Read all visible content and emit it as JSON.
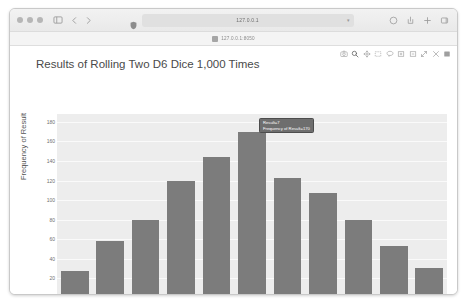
{
  "browser": {
    "traffic_lights": [
      "close",
      "minimize",
      "maximize"
    ],
    "sidebar_icon": "sidebar-icon",
    "back_icon": "chevron-left-icon",
    "forward_icon": "chevron-right-icon",
    "shield_icon": "shield-icon",
    "url_value": "127.0.0.1",
    "url_chevron": "chevron-down-icon",
    "right_icons": [
      "share-icon",
      "download-icon",
      "new-tab-icon",
      "tab-overview-icon"
    ],
    "bookmark": {
      "icon": "bookmark-icon",
      "label": "127.0.0.1:8050"
    }
  },
  "modebar": {
    "buttons": [
      {
        "name": "camera-icon",
        "label": "Download plot as a png"
      },
      {
        "name": "zoom-icon",
        "label": "Zoom"
      },
      {
        "name": "pan-icon",
        "label": "Pan"
      },
      {
        "name": "box-select-icon",
        "label": "Box Select"
      },
      {
        "name": "lasso-select-icon",
        "label": "Lasso Select"
      },
      {
        "name": "zoom-in-icon",
        "label": "Zoom in"
      },
      {
        "name": "zoom-out-icon",
        "label": "Zoom out"
      },
      {
        "name": "autoscale-icon",
        "label": "Autoscale"
      },
      {
        "name": "reset-axes-icon",
        "label": "Reset axes"
      },
      {
        "name": "toggle-spikelines-icon",
        "label": "Toggle Spike Lines"
      }
    ]
  },
  "tooltip": {
    "line1": "Result=7",
    "line2": "Frequency of Result=170"
  },
  "chart_data": {
    "type": "bar",
    "title": "Results of Rolling Two D6 Dice 1,000 Times",
    "xlabel": "Result",
    "ylabel": "Frequency of Result",
    "categories": [
      2,
      3,
      4,
      5,
      6,
      7,
      8,
      9,
      10,
      11,
      12
    ],
    "values": [
      28,
      58,
      80,
      120,
      144,
      170,
      123,
      107,
      80,
      53,
      31
    ],
    "xticklabels": [
      "2",
      "4",
      "6",
      "8",
      "10",
      "12"
    ],
    "yticklabels": [
      "0",
      "20",
      "40",
      "60",
      "80",
      "100",
      "120",
      "140",
      "160",
      "180"
    ],
    "ylim": [
      0,
      188
    ],
    "xlim": [
      1.5,
      12.5
    ],
    "grid": true,
    "legend": false,
    "bar_color": "#7c7c7c",
    "plot_bgcolor": "#ededed",
    "paper_bgcolor": "#ffffff"
  }
}
